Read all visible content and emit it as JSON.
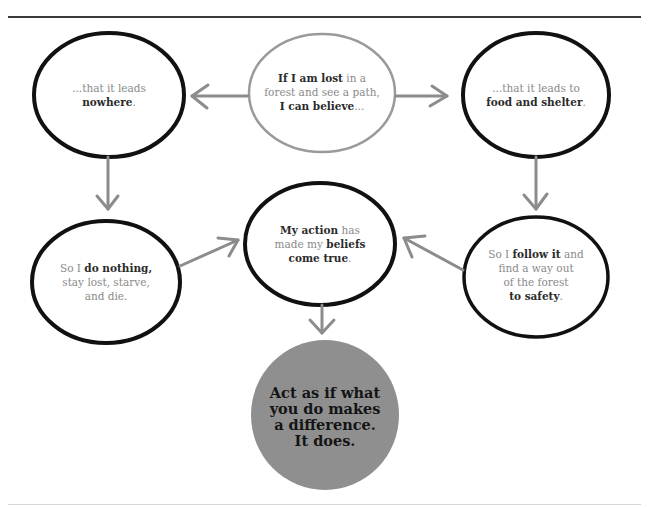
{
  "diagram": {
    "type": "flow",
    "colors": {
      "top_rule": "#3a3a3a",
      "bottom_rule": "#d6d6d6",
      "node_outline": "#111111",
      "start_node_outline": "#9a9a9a",
      "arrow": "#8c8c8c",
      "final_fill": "#8f8f8f",
      "emphasis_text": "#2b2b2b",
      "normal_text": "#8a8a8a"
    },
    "nodes": {
      "start": {
        "line1_bold": "If I am lost",
        "line1_rest": " in a",
        "line2": "forest and see a path,",
        "line3_bold": "I can believe",
        "line3_rest": "..."
      },
      "left_belief": {
        "line1": "...that it leads",
        "line2_bold": "nowhere",
        "line2_rest": "."
      },
      "right_belief": {
        "line1": "...that it leads to",
        "line2_bold": "food and shelter",
        "line2_rest": "."
      },
      "left_outcome": {
        "line1_pre": "So I ",
        "line1_bold": "do nothing,",
        "line2": "stay lost, starve,",
        "line3": "and die."
      },
      "right_outcome": {
        "line1_pre": "So I ",
        "line1_bold": "follow it",
        "line1_rest": " and",
        "line2": "find a way out",
        "line3": "of the forest",
        "line4_bold": "to safety",
        "line4_rest": "."
      },
      "conclusion": {
        "line1_bold": "My action",
        "line1_rest": " has",
        "line2_pre": "made my ",
        "line2_bold": "beliefs",
        "line3_bold": "come true",
        "line3_rest": "."
      },
      "final": {
        "line1": "Act as if what",
        "line2": "you do makes",
        "line3": "a difference.",
        "line4": "It does."
      }
    },
    "edges": [
      {
        "from": "start",
        "to": "left_belief"
      },
      {
        "from": "start",
        "to": "right_belief"
      },
      {
        "from": "left_belief",
        "to": "left_outcome"
      },
      {
        "from": "right_belief",
        "to": "right_outcome"
      },
      {
        "from": "left_outcome",
        "to": "conclusion"
      },
      {
        "from": "right_outcome",
        "to": "conclusion"
      },
      {
        "from": "conclusion",
        "to": "final"
      }
    ]
  }
}
